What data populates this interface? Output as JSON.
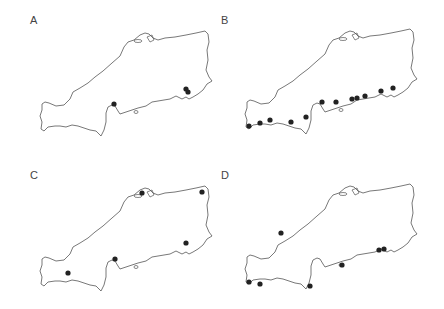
{
  "figure": {
    "panels": [
      {
        "label": "A",
        "offset": [
          0,
          0
        ],
        "points": [
          [
            114,
            104
          ],
          [
            186,
            89
          ],
          [
            188,
            92
          ]
        ]
      },
      {
        "label": "B",
        "offset": [
          205,
          -2
        ],
        "points": [
          [
            44,
            128
          ],
          [
            55,
            125
          ],
          [
            65,
            122
          ],
          [
            86,
            124
          ],
          [
            101,
            119
          ],
          [
            117,
            104
          ],
          [
            131,
            104
          ],
          [
            147,
            101
          ],
          [
            152,
            100
          ],
          [
            160,
            98
          ],
          [
            176,
            93
          ],
          [
            188,
            90
          ]
        ]
      },
      {
        "label": "C",
        "offset": [
          0,
          155
        ],
        "points": [
          [
            68,
            118
          ],
          [
            115,
            104
          ],
          [
            142,
            38
          ],
          [
            202,
            37
          ],
          [
            186,
            88
          ]
        ]
      },
      {
        "label": "D",
        "offset": [
          205,
          153
        ],
        "points": [
          [
            76,
            80
          ],
          [
            44,
            129
          ],
          [
            55,
            131
          ],
          [
            105,
            133
          ],
          [
            137,
            112
          ],
          [
            174,
            97
          ],
          [
            179,
            96
          ]
        ]
      }
    ]
  },
  "chart_data": {
    "type": "map",
    "title": "",
    "panels": [
      {
        "label": "A",
        "site_count": 3
      },
      {
        "label": "B",
        "site_count": 12
      },
      {
        "label": "C",
        "site_count": 5
      },
      {
        "label": "D",
        "site_count": 7
      }
    ]
  }
}
